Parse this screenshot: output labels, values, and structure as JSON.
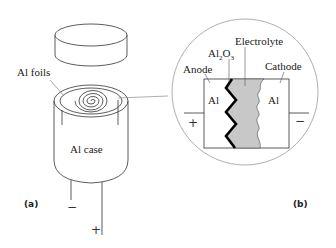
{
  "figure": {
    "part_a": {
      "tag": "(a)",
      "labels": {
        "foils": "Al foils",
        "case": "Al case"
      },
      "terminals": {
        "negative": "−",
        "positive": "+"
      }
    },
    "part_b": {
      "tag": "(b)",
      "labels": {
        "electrolyte": "Electrolyte",
        "oxide_main": "Al",
        "oxide_sub1": "2",
        "oxide_o": "O",
        "oxide_sub2": "3",
        "anode": "Anode",
        "cathode": "Cathode",
        "anode_metal": "Al",
        "cathode_metal": "Al"
      },
      "terminals": {
        "positive": "+",
        "negative": "−"
      }
    },
    "colors": {
      "electrolyte_fill": "#c8c8c8",
      "outline": "#333333",
      "circle": "#999999"
    }
  }
}
